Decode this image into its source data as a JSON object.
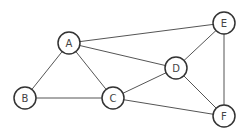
{
  "graph": {
    "type": "undirected",
    "node_radius": 11,
    "colors": {
      "background": "#ffffff",
      "edge": "#555555",
      "node_stroke": "#333333",
      "node_fill": "#ffffff",
      "label": "#444444"
    },
    "nodes": [
      {
        "id": "A",
        "label": "A",
        "x": 69,
        "y": 43
      },
      {
        "id": "B",
        "label": "B",
        "x": 25,
        "y": 98
      },
      {
        "id": "C",
        "label": "C",
        "x": 113,
        "y": 98
      },
      {
        "id": "D",
        "label": "D",
        "x": 176,
        "y": 68
      },
      {
        "id": "E",
        "label": "E",
        "x": 224,
        "y": 23
      },
      {
        "id": "F",
        "label": "F",
        "x": 224,
        "y": 116
      }
    ],
    "edges": [
      {
        "from": "A",
        "to": "E"
      },
      {
        "from": "A",
        "to": "D"
      },
      {
        "from": "A",
        "to": "B"
      },
      {
        "from": "A",
        "to": "C"
      },
      {
        "from": "B",
        "to": "C"
      },
      {
        "from": "C",
        "to": "D"
      },
      {
        "from": "C",
        "to": "F"
      },
      {
        "from": "D",
        "to": "E"
      },
      {
        "from": "D",
        "to": "F"
      },
      {
        "from": "E",
        "to": "F"
      }
    ]
  }
}
